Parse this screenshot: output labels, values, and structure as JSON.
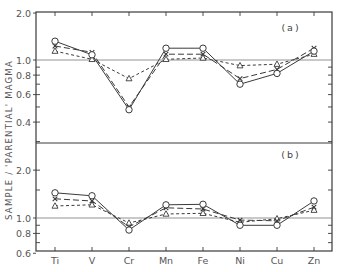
{
  "chart_data": [
    {
      "type": "line",
      "panel": "(a)",
      "ylabel": "SAMPLE / 'PARENTIAL' MAGMA",
      "yscale": "log",
      "ylim": [
        0.3,
        2.0
      ],
      "yticks_labeled": [
        2.0,
        1.0,
        0.8,
        0.6,
        0.4
      ],
      "reference_line": 1.0,
      "categories": [
        "Ti",
        "V",
        "Cr",
        "Mn",
        "Fe",
        "Ni",
        "Cu",
        "Zn"
      ],
      "series": [
        {
          "name": "circle",
          "marker": "o",
          "linestyle": "solid",
          "values": [
            1.32,
            1.08,
            0.48,
            1.19,
            1.19,
            0.7,
            0.82,
            1.14
          ]
        },
        {
          "name": "cross",
          "marker": "x",
          "linestyle": "long-dash",
          "values": [
            1.23,
            1.12,
            0.5,
            1.09,
            1.09,
            0.76,
            0.87,
            1.19
          ]
        },
        {
          "name": "triangle",
          "marker": "^",
          "linestyle": "short-dash",
          "values": [
            1.14,
            1.01,
            0.76,
            1.01,
            1.03,
            0.92,
            0.94,
            1.09
          ]
        }
      ]
    },
    {
      "type": "line",
      "panel": "(b)",
      "ylabel": "SAMPLE / 'PARENTIAL' MAGMA",
      "yscale": "log",
      "ylim": [
        0.6,
        3.0
      ],
      "yticks_labeled": [
        2.0,
        1.0,
        0.8,
        0.6
      ],
      "reference_line": 1.0,
      "categories": [
        "Ti",
        "V",
        "Cr",
        "Mn",
        "Fe",
        "Ni",
        "Cu",
        "Zn"
      ],
      "series": [
        {
          "name": "circle",
          "marker": "o",
          "linestyle": "solid",
          "values": [
            1.44,
            1.38,
            0.84,
            1.21,
            1.22,
            0.9,
            0.9,
            1.28
          ]
        },
        {
          "name": "cross",
          "marker": "x",
          "linestyle": "long-dash",
          "values": [
            1.32,
            1.28,
            0.88,
            1.16,
            1.14,
            0.97,
            0.96,
            1.17
          ]
        },
        {
          "name": "triangle",
          "marker": "^",
          "linestyle": "short-dash",
          "values": [
            1.19,
            1.21,
            0.93,
            1.06,
            1.07,
            0.94,
            0.99,
            1.12
          ]
        }
      ]
    }
  ],
  "labels": {
    "ylabel": "SAMPLE / 'PARENTIAL' MAGMA",
    "panel_a": "(a)",
    "panel_b": "(b)",
    "xcategories": [
      "Ti",
      "V",
      "Cr",
      "Mn",
      "Fe",
      "Ni",
      "Cu",
      "Zn"
    ],
    "yticks_a": [
      "2.0",
      "1.0",
      "0.8",
      "0.6",
      "0.4"
    ],
    "yticks_b": [
      "2.0",
      "1.0",
      "0.8",
      "0.6"
    ]
  }
}
